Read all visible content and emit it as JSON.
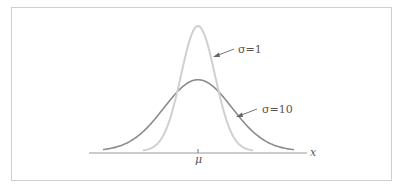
{
  "chart_data": {
    "type": "line",
    "title": "",
    "xlabel": "x",
    "ylabel": "",
    "x_tick_labels": [
      "μ"
    ],
    "grid": false,
    "legend": "none",
    "annotations": [
      {
        "text": "σ=1",
        "points_to": "narrow curve, right side"
      },
      {
        "text": "σ=10",
        "points_to": "wide curve, right side"
      }
    ],
    "series": [
      {
        "name": "σ=1",
        "color": "#d0d0d0",
        "shape": "normal density, narrow and tall",
        "relative_peak_height": 1.0,
        "relative_width": 0.45
      },
      {
        "name": "σ=10",
        "color": "#8c8c8c",
        "shape": "normal density, wide and short",
        "relative_peak_height": 0.57,
        "relative_width": 1.0
      }
    ],
    "center": "μ"
  },
  "labels": {
    "sigma1": "σ=1",
    "sigma10": "σ=10",
    "mu": "μ",
    "x": "x"
  },
  "colors": {
    "narrow_curve": "#d0d0d0",
    "wide_curve": "#8c8c8c",
    "axis": "#9a9a9a",
    "text": "#555555",
    "frame": "#cfcfcf"
  }
}
